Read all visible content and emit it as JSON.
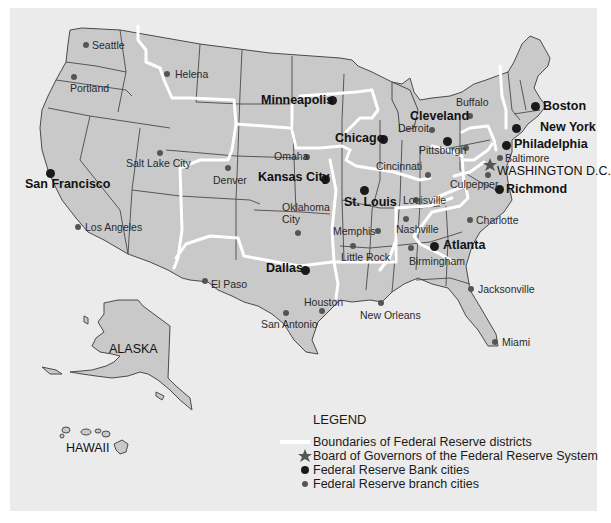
{
  "map": {
    "title": "Federal Reserve Districts",
    "colors": {
      "background": "#ebebeb",
      "land": "#c9c9c9",
      "state_border": "#4a4a4a",
      "district_boundary": "#ffffff",
      "bank_city_dot": "#1a1a1a",
      "branch_city_dot": "#555555",
      "board_star": "#555555"
    },
    "regions": {
      "alaska": "ALASKA",
      "hawaii": "HAWAII"
    },
    "bank_cities": [
      {
        "name": "Boston",
        "x": 535,
        "y": 106
      },
      {
        "name": "New York",
        "x": 516,
        "y": 128
      },
      {
        "name": "Philadelphia",
        "x": 506,
        "y": 145
      },
      {
        "name": "Cleveland",
        "x": 447,
        "y": 141
      },
      {
        "name": "Richmond",
        "x": 499,
        "y": 189
      },
      {
        "name": "Atlanta",
        "x": 434,
        "y": 246
      },
      {
        "name": "Chicago",
        "x": 383,
        "y": 139
      },
      {
        "name": "St. Louis",
        "x": 364,
        "y": 190
      },
      {
        "name": "Minneapolis",
        "x": 332,
        "y": 100
      },
      {
        "name": "Kansas City",
        "x": 325,
        "y": 179
      },
      {
        "name": "Dallas",
        "x": 305,
        "y": 270
      },
      {
        "name": "San Francisco",
        "x": 50,
        "y": 173
      }
    ],
    "board_of_governors": {
      "name": "WASHINGTON D.C.",
      "x": 490,
      "y": 165
    },
    "branch_cities": [
      {
        "name": "Seattle",
        "x": 86,
        "y": 45
      },
      {
        "name": "Portland",
        "x": 74,
        "y": 77
      },
      {
        "name": "Helena",
        "x": 167,
        "y": 74
      },
      {
        "name": "Salt Lake City",
        "x": 160,
        "y": 153
      },
      {
        "name": "Denver",
        "x": 228,
        "y": 168
      },
      {
        "name": "Los Angeles",
        "x": 78,
        "y": 227
      },
      {
        "name": "Omaha",
        "x": 307,
        "y": 157
      },
      {
        "name": "Oklahoma City",
        "x": 298,
        "y": 233
      },
      {
        "name": "El Paso",
        "x": 205,
        "y": 281
      },
      {
        "name": "San Antonio",
        "x": 286,
        "y": 313
      },
      {
        "name": "Houston",
        "x": 322,
        "y": 311
      },
      {
        "name": "New Orleans",
        "x": 381,
        "y": 303
      },
      {
        "name": "Little Rock",
        "x": 353,
        "y": 246
      },
      {
        "name": "Memphis",
        "x": 378,
        "y": 231
      },
      {
        "name": "Nashville",
        "x": 406,
        "y": 219
      },
      {
        "name": "Birmingham",
        "x": 411,
        "y": 248
      },
      {
        "name": "Louisville",
        "x": 416,
        "y": 200
      },
      {
        "name": "Cincinnati",
        "x": 428,
        "y": 175
      },
      {
        "name": "Detroit",
        "x": 432,
        "y": 130
      },
      {
        "name": "Pittsburgh",
        "x": 466,
        "y": 148
      },
      {
        "name": "Buffalo",
        "x": 470,
        "y": 116
      },
      {
        "name": "Baltimore",
        "x": 500,
        "y": 158
      },
      {
        "name": "Culpepper",
        "x": 488,
        "y": 175
      },
      {
        "name": "Charlotte",
        "x": 470,
        "y": 220
      },
      {
        "name": "Jacksonville",
        "x": 471,
        "y": 289
      },
      {
        "name": "Miami",
        "x": 495,
        "y": 342
      }
    ]
  },
  "legend": {
    "title": "LEGEND",
    "items": [
      {
        "symbol": "white-line",
        "label": "Boundaries of Federal Reserve districts"
      },
      {
        "symbol": "star",
        "label": "Board of Governors of the Federal Reserve System"
      },
      {
        "symbol": "large-dot",
        "label": "Federal Reserve Bank cities"
      },
      {
        "symbol": "small-dot",
        "label": "Federal Reserve branch cities"
      }
    ]
  }
}
